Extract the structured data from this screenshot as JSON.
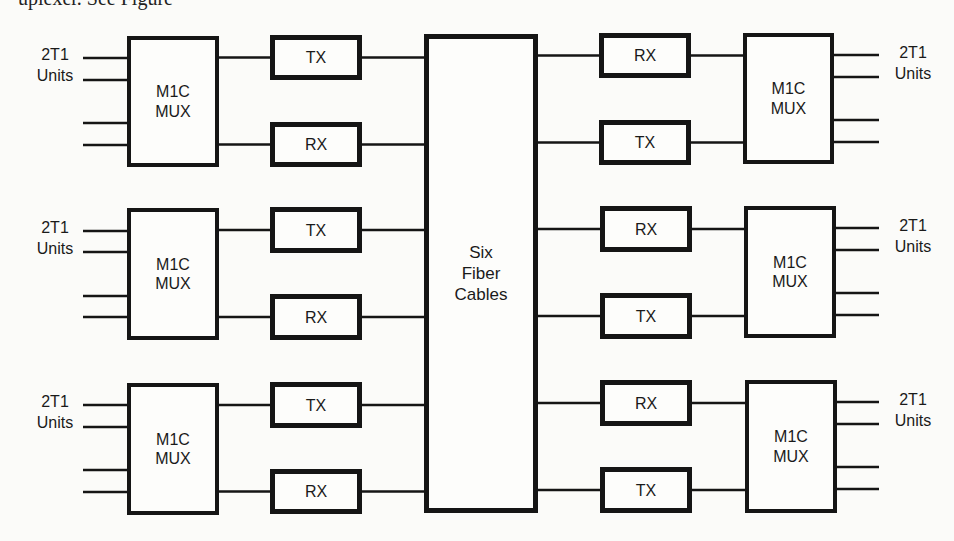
{
  "caption_fragment": "uplexer. See Figure",
  "colors": {
    "line": "#151515",
    "box_fill": "#fdfdfb",
    "background": "#fbfbf9",
    "text": "#1a1a1a"
  },
  "center": {
    "lines": [
      "Six",
      "Fiber",
      "Cables"
    ],
    "x": 424,
    "y": 34,
    "w": 114,
    "h": 479
  },
  "left_groups": [
    {
      "units_label": [
        "2T1",
        "Units"
      ],
      "mux": {
        "lines": [
          "M1C",
          "MUX"
        ],
        "x": 127,
        "y": 36,
        "w": 92,
        "h": 131
      },
      "top_module": {
        "label": "TX",
        "x": 270,
        "y": 35,
        "w": 92,
        "h": 45
      },
      "bottom_module": {
        "label": "RX",
        "x": 270,
        "y": 122,
        "w": 92,
        "h": 45
      },
      "unit_lines_y": [
        58,
        80,
        123,
        145
      ]
    },
    {
      "units_label": [
        "2T1",
        "Units"
      ],
      "mux": {
        "lines": [
          "M1C",
          "MUX"
        ],
        "x": 127,
        "y": 208,
        "w": 92,
        "h": 132
      },
      "top_module": {
        "label": "TX",
        "x": 270,
        "y": 207,
        "w": 92,
        "h": 46
      },
      "bottom_module": {
        "label": "RX",
        "x": 270,
        "y": 294,
        "w": 92,
        "h": 46
      },
      "unit_lines_y": [
        231,
        252,
        296,
        317
      ]
    },
    {
      "units_label": [
        "2T1",
        "Units"
      ],
      "mux": {
        "lines": [
          "M1C",
          "MUX"
        ],
        "x": 127,
        "y": 383,
        "w": 92,
        "h": 132
      },
      "top_module": {
        "label": "TX",
        "x": 270,
        "y": 382,
        "w": 92,
        "h": 46
      },
      "bottom_module": {
        "label": "RX",
        "x": 270,
        "y": 469,
        "w": 92,
        "h": 45
      },
      "unit_lines_y": [
        405,
        427,
        470,
        492
      ]
    }
  ],
  "right_groups": [
    {
      "units_label": [
        "2T1",
        "Units"
      ],
      "mux": {
        "lines": [
          "M1C",
          "MUX"
        ],
        "x": 743,
        "y": 33,
        "w": 91,
        "h": 131
      },
      "top_module": {
        "label": "RX",
        "x": 599,
        "y": 33,
        "w": 92,
        "h": 45
      },
      "bottom_module": {
        "label": "TX",
        "x": 599,
        "y": 120,
        "w": 92,
        "h": 45
      },
      "unit_lines_y": [
        55,
        77,
        120,
        142
      ]
    },
    {
      "units_label": [
        "2T1",
        "Units"
      ],
      "mux": {
        "lines": [
          "M1C",
          "MUX"
        ],
        "x": 744,
        "y": 206,
        "w": 92,
        "h": 132
      },
      "top_module": {
        "label": "RX",
        "x": 600,
        "y": 206,
        "w": 92,
        "h": 46
      },
      "bottom_module": {
        "label": "TX",
        "x": 600,
        "y": 293,
        "w": 92,
        "h": 46
      },
      "unit_lines_y": [
        228,
        250,
        293,
        315
      ]
    },
    {
      "units_label": [
        "2T1",
        "Units"
      ],
      "mux": {
        "lines": [
          "M1C",
          "MUX"
        ],
        "x": 745,
        "y": 380,
        "w": 92,
        "h": 133
      },
      "top_module": {
        "label": "RX",
        "x": 600,
        "y": 380,
        "w": 92,
        "h": 46
      },
      "bottom_module": {
        "label": "TX",
        "x": 600,
        "y": 467,
        "w": 92,
        "h": 46
      },
      "unit_lines_y": [
        402,
        424,
        467,
        489
      ]
    }
  ]
}
